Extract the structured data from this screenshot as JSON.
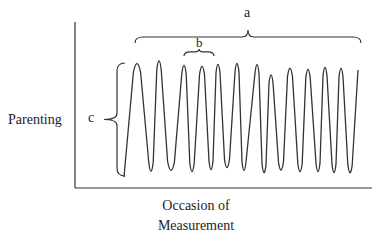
{
  "figure": {
    "y_axis_label": "Parenting",
    "x_axis_label_line1": "Occasion of",
    "x_axis_label_line2": "Measurement",
    "annotations": {
      "a": "a",
      "b": "b",
      "c": "c"
    },
    "annotation_meanings": {
      "a": "span of all measurement occasions",
      "b": "period of one oscillation",
      "c": "amplitude of oscillation"
    },
    "stroke_color": "#333333",
    "axis": {
      "origin_x": 75,
      "top_y": 22,
      "baseline_y": 188,
      "right_x": 372
    },
    "wave": {
      "start": [
        124,
        177
      ],
      "points": [
        [
          137,
          58
        ],
        [
          151,
          177
        ],
        [
          159,
          55
        ],
        [
          171,
          176
        ],
        [
          184,
          60
        ],
        [
          192,
          177
        ],
        [
          202,
          61
        ],
        [
          211,
          175
        ],
        [
          218,
          59
        ],
        [
          227,
          173
        ],
        [
          237,
          58
        ],
        [
          244,
          176
        ],
        [
          257,
          59
        ],
        [
          264,
          178
        ],
        [
          271,
          70
        ],
        [
          281,
          175
        ],
        [
          290,
          63
        ],
        [
          300,
          177
        ],
        [
          308,
          64
        ],
        [
          318,
          177
        ],
        [
          325,
          62
        ],
        [
          334,
          178
        ],
        [
          341,
          63
        ],
        [
          350,
          178
        ],
        [
          358,
          70
        ]
      ]
    },
    "brace_a": {
      "x1": 135,
      "x2": 361,
      "y": 43,
      "tip_y": 30
    },
    "brace_b": {
      "x1": 184,
      "x2": 214,
      "y": 56,
      "tip_y": 49
    },
    "brace_c": {
      "x": 117,
      "y1": 63,
      "y2": 176,
      "tip_x": 104
    }
  }
}
